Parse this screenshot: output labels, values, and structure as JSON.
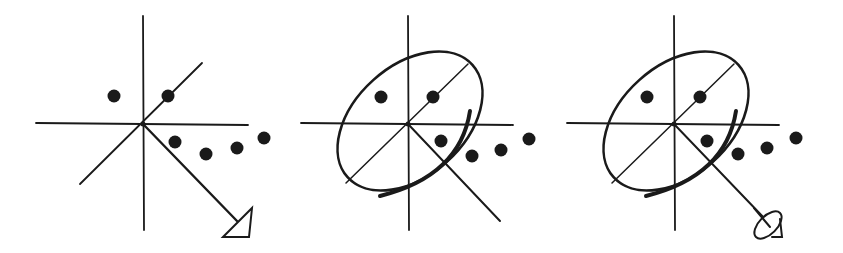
{
  "figure": {
    "colors": {
      "ink": "#1a1a1a",
      "background": "#ffffff"
    },
    "panels": [
      {
        "id": "panel-1",
        "elements": [
          "axes",
          "diagonal-axis",
          "data-points",
          "view-arrow-triangle"
        ],
        "origin": [
          143,
          124
        ],
        "points": [
          [
            114,
            96
          ],
          [
            168,
            96
          ],
          [
            175,
            142
          ],
          [
            206,
            154
          ],
          [
            237,
            148
          ],
          [
            264,
            138
          ]
        ]
      },
      {
        "id": "panel-2",
        "elements": [
          "axes",
          "diagonal-axis",
          "data-points",
          "projection-ellipse",
          "direction-line"
        ],
        "origin": [
          408,
          124
        ],
        "points": [
          [
            381,
            97
          ],
          [
            433,
            97
          ],
          [
            441,
            141
          ],
          [
            472,
            156
          ],
          [
            501,
            150
          ],
          [
            529,
            139
          ]
        ]
      },
      {
        "id": "panel-3",
        "elements": [
          "axes",
          "diagonal-axis",
          "data-points",
          "projection-ellipse",
          "view-arrow-dish"
        ],
        "origin": [
          674,
          124
        ],
        "points": [
          [
            647,
            97
          ],
          [
            700,
            97
          ],
          [
            707,
            141
          ],
          [
            738,
            154
          ],
          [
            767,
            148
          ],
          [
            796,
            138
          ]
        ]
      }
    ]
  }
}
